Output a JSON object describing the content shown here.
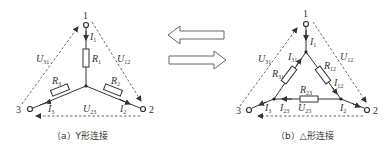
{
  "diagram_a": {
    "caption": "（a）Y形连接",
    "nodes": {
      "n1": "1",
      "n2": "2",
      "n3": "3"
    },
    "resistors": {
      "r1": "R",
      "r1_sub": "1",
      "r2": "R",
      "r2_sub": "2",
      "r3": "R",
      "r3_sub": "3"
    },
    "currents": {
      "i1": "I",
      "i1_sub": "1",
      "i2": "I",
      "i2_sub": "2",
      "i3": "I",
      "i3_sub": "3"
    },
    "voltages": {
      "u12": "U",
      "u12_sub": "12",
      "u23": "U",
      "u23_sub": "23",
      "u31": "U",
      "u31_sub": "31"
    }
  },
  "diagram_b": {
    "caption": "（b）△形连接",
    "nodes": {
      "n1": "1",
      "n2": "2",
      "n3": "3"
    },
    "resistors": {
      "r12": "R",
      "r12_sub": "12",
      "r23": "R",
      "r23_sub": "23",
      "r31": "R",
      "r31_sub": "31"
    },
    "currents": {
      "i1": "I",
      "i1_sub": "1",
      "i2": "I",
      "i2_sub": "2",
      "i3": "I",
      "i3_sub": "3",
      "i12": "I",
      "i12_sub": "12",
      "i23": "I",
      "i23_sub": "23",
      "i31": "I",
      "i31_sub": "31"
    },
    "voltages": {
      "u12": "U",
      "u12_sub": "12",
      "u23": "U",
      "u23_sub": "23",
      "u31": "U",
      "u31_sub": "31"
    }
  },
  "transform_arrows": {
    "left": "Δ-to-Y arrow",
    "right": "Y-to-Δ arrow"
  }
}
